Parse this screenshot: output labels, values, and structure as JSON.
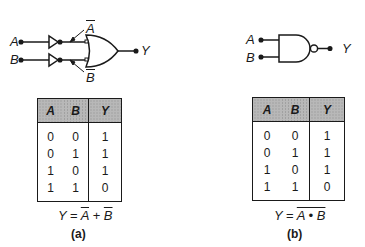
{
  "panels": [
    {
      "id": "a",
      "caption": "(a)",
      "gate": "OR with inverted inputs",
      "inputs": [
        "A",
        "B"
      ],
      "output": "Y",
      "inverted_labels": [
        "A",
        "B"
      ],
      "formula": {
        "lhs": "Y",
        "eq": "=",
        "terms": [
          "A",
          "+",
          "B"
        ]
      },
      "truth_table": {
        "headers": [
          "A",
          "B",
          "Y"
        ],
        "rows": [
          [
            "0",
            "0",
            "1"
          ],
          [
            "0",
            "1",
            "1"
          ],
          [
            "1",
            "0",
            "1"
          ],
          [
            "1",
            "1",
            "0"
          ]
        ]
      }
    },
    {
      "id": "b",
      "caption": "(b)",
      "gate": "NAND",
      "inputs": [
        "A",
        "B"
      ],
      "output": "Y",
      "formula": {
        "lhs": "Y",
        "eq": "=",
        "expr": "A • B"
      },
      "truth_table": {
        "headers": [
          "A",
          "B",
          "Y"
        ],
        "rows": [
          [
            "0",
            "0",
            "1"
          ],
          [
            "0",
            "1",
            "1"
          ],
          [
            "1",
            "0",
            "1"
          ],
          [
            "1",
            "1",
            "0"
          ]
        ]
      }
    }
  ]
}
